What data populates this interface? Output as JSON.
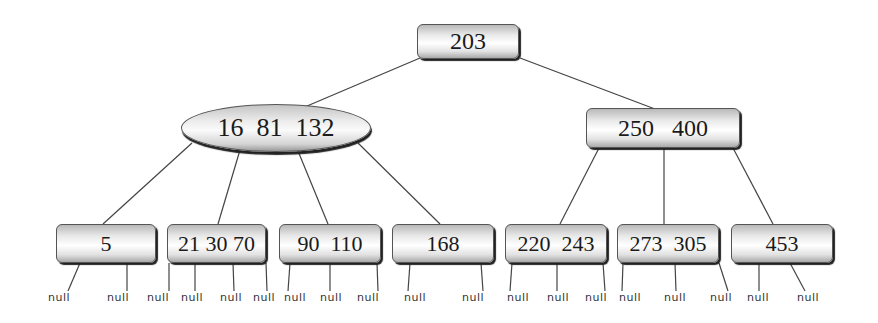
{
  "diagram": {
    "type": "b-tree",
    "root": {
      "keys": "203"
    },
    "level1": [
      {
        "keys": "16  81  132",
        "shape": "ellipse"
      },
      {
        "keys": "250   400",
        "shape": "rounded-rect"
      }
    ],
    "leaves": [
      {
        "keys": "5"
      },
      {
        "keys": "21 30 70"
      },
      {
        "keys": "90  110"
      },
      {
        "keys": "168"
      },
      {
        "keys": "220  243"
      },
      {
        "keys": "273  305"
      },
      {
        "keys": "453"
      }
    ],
    "null_label": "null"
  }
}
